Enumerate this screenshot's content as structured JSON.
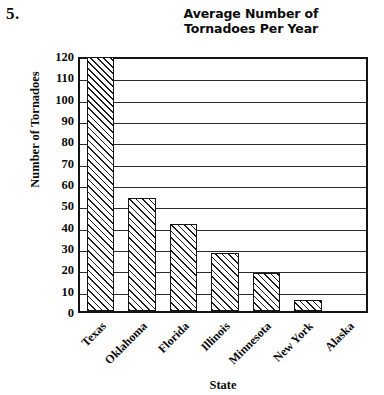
{
  "problem": {
    "number_label": "5."
  },
  "chart_data": {
    "type": "bar",
    "title": "Average Number of Tornadoes Per Year",
    "title_lines": [
      "Average Number of",
      "Tornadoes Per Year"
    ],
    "xlabel": "State",
    "ylabel": "Number of Tornadoes",
    "categories": [
      "Texas",
      "Oklahoma",
      "Florida",
      "Illinois",
      "Minnesota",
      "New York",
      "Alaska"
    ],
    "values": [
      119,
      53,
      41,
      27,
      18,
      5,
      0
    ],
    "ylim": [
      0,
      120
    ],
    "ytick_step": 10,
    "ytick_labels": [
      "120",
      "110",
      "100",
      "90",
      "80",
      "70",
      "60",
      "50",
      "40",
      "30",
      "20",
      "10",
      "0"
    ],
    "grid": true,
    "grid_axis": "y",
    "legend": "none",
    "bar_fill": "diagonal-hatch",
    "bar_edge_color": "#141414",
    "bar_face_color": "#ffffff",
    "frame_color": "#141414"
  }
}
